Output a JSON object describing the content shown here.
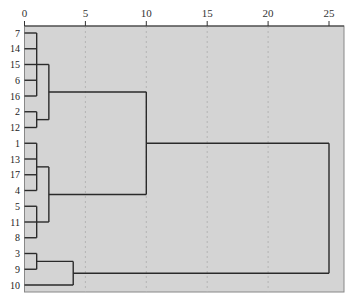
{
  "chart_data": {
    "type": "dendrogram",
    "title": "",
    "xlabel": "",
    "ylabel": "",
    "xlim": [
      0,
      26.2
    ],
    "x_ticks": [
      0,
      5,
      10,
      15,
      20,
      25
    ],
    "grid": "vertical dashed at 5,10,15,20",
    "leaves": [
      "7",
      "14",
      "15",
      "6",
      "16",
      "2",
      "12",
      "1",
      "13",
      "17",
      "4",
      "5",
      "11",
      "8",
      "3",
      "9",
      "10"
    ],
    "merges": [
      {
        "members": [
          "7",
          "14",
          "15",
          "6",
          "16"
        ],
        "height": 1.0
      },
      {
        "members": [
          "2",
          "12"
        ],
        "height": 1.0
      },
      {
        "members": [
          "7-16 group",
          "2-12 group"
        ],
        "height": 2.0
      },
      {
        "members": [
          "1",
          "13",
          "17",
          "4"
        ],
        "height": 1.0
      },
      {
        "members": [
          "5",
          "11",
          "8"
        ],
        "height": 1.0
      },
      {
        "members": [
          "1-4 group",
          "5-8 group"
        ],
        "height": 2.0
      },
      {
        "members": [
          "top cluster (7..12)",
          "middle cluster (1..8)"
        ],
        "height": 10.0
      },
      {
        "members": [
          "3",
          "9"
        ],
        "height": 1.0
      },
      {
        "members": [
          "3-9 group",
          "10"
        ],
        "height": 4.0
      },
      {
        "members": [
          "clusters 7..8",
          "cluster 3,9,10"
        ],
        "height": 25.0
      }
    ]
  },
  "colors": {
    "plot_bg": "#d4d4d4",
    "line": "#2a2a2a",
    "grid": "#b4b4b4"
  }
}
